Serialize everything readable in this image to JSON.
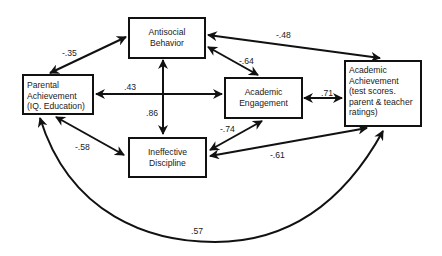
{
  "nodes": {
    "parental": {
      "lines": [
        "Parental",
        "Achievement",
        "(IQ. Education)"
      ]
    },
    "antisocial": {
      "lines": [
        "Antisocial",
        "Behavior"
      ]
    },
    "engagement": {
      "lines": [
        "Academic",
        "Engagement"
      ]
    },
    "achievement": {
      "lines": [
        "Academic",
        "Achievement",
        "(test scores.",
        "parent  & teacher",
        "ratings)"
      ]
    },
    "discipline": {
      "lines": [
        "Ineffective",
        "Discipline"
      ]
    }
  },
  "edges": [
    {
      "from": "parental",
      "to": "antisocial",
      "coefficient": "-.35"
    },
    {
      "from": "antisocial",
      "to": "achievement",
      "coefficient": "-.48"
    },
    {
      "from": "antisocial",
      "to": "engagement",
      "coefficient": "-.64"
    },
    {
      "from": "parental",
      "to": "engagement",
      "coefficient": ".43"
    },
    {
      "from": "antisocial",
      "to": "discipline",
      "coefficient": ".86"
    },
    {
      "from": "engagement",
      "to": "achievement",
      "coefficient": ".71"
    },
    {
      "from": "discipline",
      "to": "engagement",
      "coefficient": "-.74"
    },
    {
      "from": "discipline",
      "to": "achievement",
      "coefficient": "-.61"
    },
    {
      "from": "parental",
      "to": "discipline",
      "coefficient": "-.58"
    },
    {
      "from": "parental",
      "to": "achievement",
      "coefficient": ".57"
    }
  ],
  "colors": {
    "line": "#111111",
    "background": "#ffffff"
  }
}
